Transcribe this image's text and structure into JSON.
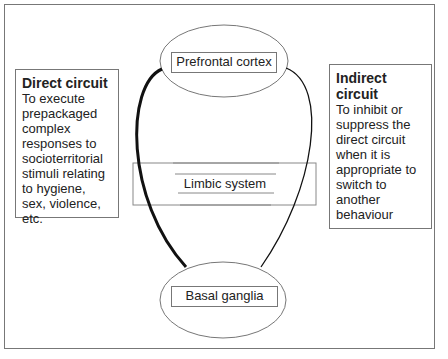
{
  "diagram": {
    "nodes": {
      "prefrontal": {
        "label": "Prefrontal cortex"
      },
      "limbic": {
        "label": "Limbic system"
      },
      "basal": {
        "label": "Basal ganglia"
      }
    },
    "direct": {
      "title": "Direct circuit",
      "body": "To execute prepackaged complex responses to socioterritorial stimuli relating to hygiene, sex, violence, etc."
    },
    "indirect": {
      "title": "Indirect circuit",
      "body": "To inhibit or suppress the direct circuit when it is appropriate to switch to another behaviour"
    },
    "edges": [
      {
        "from": "Prefrontal cortex",
        "to": "Basal ganglia",
        "side": "left",
        "style": "thick",
        "circuit": "Direct circuit"
      },
      {
        "from": "Prefrontal cortex",
        "to": "Basal ganglia",
        "side": "right",
        "style": "thin",
        "circuit": "Indirect circuit"
      }
    ]
  }
}
